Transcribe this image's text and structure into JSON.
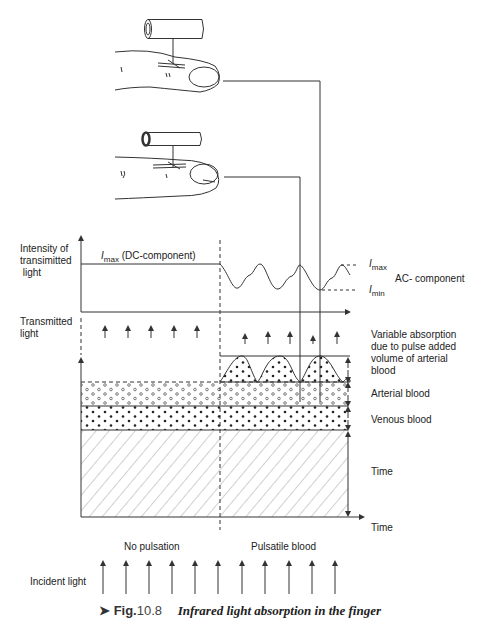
{
  "labels": {
    "intensity_axis": [
      "Intensity of",
      "transimitted",
      " light"
    ],
    "imax_dc": "max",
    "imax_dc_suffix": " (DC-component)",
    "imax_right": "max",
    "imin_right": "min",
    "ac_component": "AC- component",
    "transmitted_light": [
      "Transmitted",
      "light"
    ],
    "variable_absorption": [
      "Variable absorption",
      "due to pulse added",
      "volume of arterial",
      "blood"
    ],
    "arterial_blood": "Arterial blood",
    "venous_blood": "Venous blood",
    "time_inner": "Time",
    "time_axis": "Time",
    "no_pulsation": "No pulsation",
    "pulsatile_blood": "Pulsatile blood",
    "incident_light": "Incident light",
    "I_symbol": "I"
  },
  "caption": {
    "marker": "➤",
    "fig": "Fig.",
    "number": "10.8",
    "title": "Infrared light absorption in the finger"
  },
  "colors": {
    "line": "#333333",
    "text": "#222222"
  }
}
